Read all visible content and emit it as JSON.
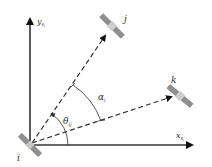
{
  "diagram": {
    "axes": {
      "x_label": "x",
      "x_subscript": "s",
      "x_subsubscript": "i",
      "y_label": "y",
      "y_subscript": "s",
      "y_subsubscript": "i"
    },
    "nodes": [
      {
        "id": "i",
        "label": "i",
        "role": "origin satellite"
      },
      {
        "id": "j",
        "label": "j",
        "role": "target satellite"
      },
      {
        "id": "k",
        "label": "k",
        "role": "target satellite"
      }
    ],
    "edges": [
      {
        "from": "i",
        "to": "j",
        "style": "dashed",
        "arrow": true
      },
      {
        "from": "i",
        "to": "k",
        "style": "dashed",
        "arrow": true
      }
    ],
    "angles": [
      {
        "symbol": "θ",
        "subscript": "ij",
        "between": "x-axis and i→j line"
      },
      {
        "symbol": "α",
        "subscript": "i",
        "between": "i→k line and i→j line"
      }
    ],
    "colors": {
      "axis": "#222222",
      "dashed": "#333333",
      "satellite_panel": "#8a8a8a",
      "satellite_body": "#bdbdbd",
      "label": "#333333"
    }
  }
}
